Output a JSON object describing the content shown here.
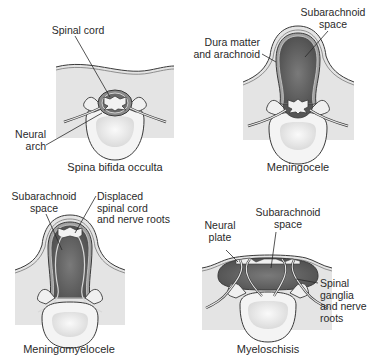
{
  "colors": {
    "tissue": "#e4e4e4",
    "outline": "#3a3a3a",
    "csf_dark": "#5c5c5c",
    "membrane": "#bdbdbd",
    "vertebral_body": "#f3f3f3",
    "cord": "#f2f2f2",
    "text": "#2a2a2a"
  },
  "panels": [
    {
      "id": "spina-bifida-occulta",
      "caption": "Spina bifida occulta",
      "labels": [
        {
          "text": "Spinal cord"
        },
        {
          "text": "Neural\narch"
        }
      ]
    },
    {
      "id": "meningocele",
      "caption": "Meningocele",
      "labels": [
        {
          "text": "Subarachnoid\nspace"
        },
        {
          "text": "Dura matter\nand arachnoid"
        }
      ]
    },
    {
      "id": "meningomyelocele",
      "caption": "Meningomyelocele",
      "labels": [
        {
          "text": "Subarachnoid\nspace"
        },
        {
          "text": "Displaced\nspinal cord\nand nerve roots"
        }
      ]
    },
    {
      "id": "myeloschisis",
      "caption": "Myeloschisis",
      "labels": [
        {
          "text": "Neural\nplate"
        },
        {
          "text": "Subarachnoid\nspace"
        },
        {
          "text": "Spinal\nganglia\nand nerve\nroots"
        }
      ]
    }
  ]
}
